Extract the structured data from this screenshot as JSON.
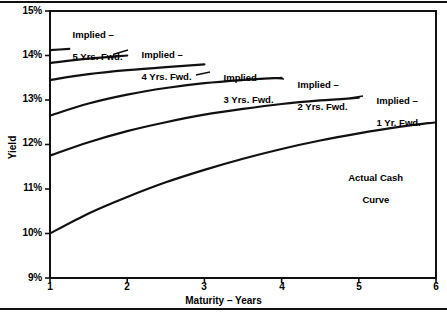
{
  "chart_data": {
    "type": "line",
    "title": "",
    "xlabel": "Maturity – Years",
    "ylabel": "Yield",
    "xlim": [
      1,
      6
    ],
    "ylim": [
      9,
      15
    ],
    "grid": false,
    "legend_position": "inline-annotations",
    "xticks": [
      "1",
      "2",
      "3",
      "4",
      "5",
      "6"
    ],
    "xtick_values": [
      1,
      2,
      3,
      4,
      5,
      6
    ],
    "yticks": [
      "9%",
      "10%",
      "11%",
      "12%",
      "13%",
      "14%",
      "15%"
    ],
    "ytick_values": [
      9,
      10,
      11,
      12,
      13,
      14,
      15
    ],
    "series": [
      {
        "name": "Actual Cash Curve",
        "label": "Actual Cash\nCurve",
        "x": [
          1,
          1.5,
          2,
          2.5,
          3,
          3.5,
          4,
          4.5,
          5,
          5.5,
          6
        ],
        "values": [
          10.0,
          10.45,
          10.82,
          11.15,
          11.43,
          11.68,
          11.9,
          12.09,
          12.25,
          12.39,
          12.5
        ]
      },
      {
        "name": "Implied - 1 Yr. Fwd.",
        "label": "Implied –\n1 Yr. Fwd.",
        "x": [
          1,
          1.5,
          2,
          2.5,
          3,
          3.5,
          4,
          4.5,
          5
        ],
        "values": [
          11.75,
          12.05,
          12.3,
          12.5,
          12.67,
          12.8,
          12.91,
          12.99,
          13.05
        ]
      },
      {
        "name": "Implied - 2 Yrs. Fwd.",
        "label": "Implied –\n2 Yrs. Fwd.",
        "x": [
          1,
          1.5,
          2,
          2.5,
          3,
          3.5,
          4
        ],
        "values": [
          12.65,
          12.92,
          13.12,
          13.27,
          13.38,
          13.45,
          13.5
        ]
      },
      {
        "name": "Implied - 3 Yrs. Fwd.",
        "label": "Implied –\n3 Yrs. Fwd.",
        "x": [
          1,
          1.5,
          2,
          2.5,
          3
        ],
        "values": [
          13.45,
          13.58,
          13.67,
          13.74,
          13.8
        ]
      },
      {
        "name": "Implied - 4 Yrs. Fwd.",
        "label": "Implied –\n4 Yrs. Fwd.",
        "x": [
          1,
          1.5,
          2
        ],
        "values": [
          13.83,
          13.93,
          14.0
        ]
      },
      {
        "name": "Implied - 5 Yrs. Fwd.",
        "label": "Implied –\n5 Yrs. Fwd.",
        "x": [
          1,
          1.25
        ],
        "values": [
          14.12,
          14.15
        ]
      }
    ]
  },
  "axes": {
    "y_title": "Yield",
    "x_title": "Maturity – Years",
    "y_tick_labels": [
      "15%",
      "14%",
      "13%",
      "12%",
      "11%",
      "10%",
      "9%"
    ],
    "x_tick_labels": [
      "1",
      "2",
      "3",
      "4",
      "5",
      "6"
    ]
  },
  "annotations": {
    "implied_5yr_line1": "Implied –",
    "implied_5yr_line2": "5 Yrs. Fwd.",
    "implied_4yr_line1": "Implied –",
    "implied_4yr_line2": "4 Yrs. Fwd.",
    "implied_3yr_line1": "Implied –",
    "implied_3yr_line2": "3 Yrs. Fwd.",
    "implied_2yr_line1": "Implied –",
    "implied_2yr_line2": "2 Yrs. Fwd.",
    "implied_1yr_line1": "Implied –",
    "implied_1yr_line2": "1 Yr. Fwd.",
    "actual_cash_line1": "Actual Cash",
    "actual_cash_line2": "Curve"
  },
  "style": {
    "line_color": "#111111",
    "frame_color": "#111111",
    "background": "#ffffff"
  }
}
